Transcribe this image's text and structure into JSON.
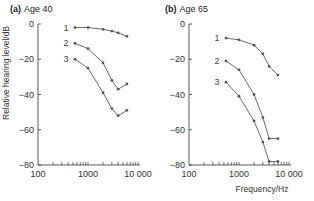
{
  "chart_data": [
    {
      "type": "line",
      "panel": "(a)",
      "title": "Age 40",
      "xlabel": "",
      "ylabel": "Relative hearing level/dB",
      "xscale": "log",
      "xlim": [
        100,
        10000
      ],
      "ylim": [
        -80,
        0
      ],
      "xticks": [
        "100",
        "1000",
        "10 000"
      ],
      "yticks": [
        "0",
        "−20",
        "−40",
        "−60",
        "−80"
      ],
      "x": [
        550,
        1000,
        2000,
        3000,
        4000,
        6000
      ],
      "series": [
        {
          "name": "1",
          "values": [
            -2,
            -2,
            -3,
            -4,
            -5,
            -7
          ]
        },
        {
          "name": "2",
          "values": [
            -11,
            -14,
            -22,
            -32,
            -37,
            -34
          ]
        },
        {
          "name": "3",
          "values": [
            -20,
            -25,
            -39,
            -48,
            -52,
            -49
          ]
        }
      ],
      "grid": false,
      "legend": "inline labels"
    },
    {
      "type": "line",
      "panel": "(b)",
      "title": "Age 65",
      "xlabel": "Frequency/Hz",
      "ylabel": "",
      "xscale": "log",
      "xlim": [
        100,
        10000
      ],
      "ylim": [
        -80,
        0
      ],
      "xticks": [
        "100",
        "1000",
        "10 000"
      ],
      "yticks": [
        "0",
        "−20",
        "−40",
        "−60",
        "−80"
      ],
      "x": [
        550,
        1000,
        2000,
        3000,
        4000,
        6000
      ],
      "series": [
        {
          "name": "1",
          "values": [
            -8,
            -9,
            -12,
            -17,
            -24,
            -29
          ]
        },
        {
          "name": "2",
          "values": [
            -21,
            -26,
            -40,
            -53,
            -65,
            -65
          ]
        },
        {
          "name": "3",
          "values": [
            -33,
            -41,
            -55,
            -67,
            -78,
            -78
          ]
        }
      ],
      "grid": false,
      "legend": "inline labels"
    }
  ],
  "panels": [
    {
      "letter": "(a)",
      "title": "Age 40"
    },
    {
      "letter": "(b)",
      "title": "Age 65"
    }
  ],
  "ylabel": "Relative hearing level/dB",
  "xlabel": "Frequency/Hz",
  "yticks": [
    "0",
    "−20",
    "−40",
    "−60",
    "−80"
  ],
  "xticks": [
    "100",
    "1000",
    "10 000"
  ],
  "curve_labels": [
    "1",
    "2",
    "3"
  ],
  "colors": {
    "line": "#6b6b6b",
    "marker": "#555555",
    "axis": "#333333"
  }
}
